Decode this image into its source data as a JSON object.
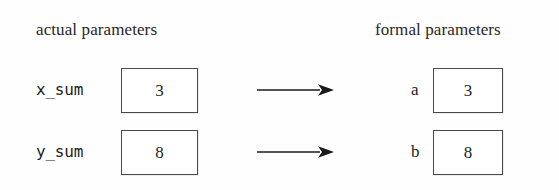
{
  "diagram": {
    "headers": {
      "actual": "actual parameters",
      "formal": "formal parameters"
    },
    "colors": {
      "background": "#fefefe",
      "text": "#231f20",
      "box_border": "#4a4a4a",
      "arrow": "#1a1a1a"
    },
    "rows": [
      {
        "actual_label": "x_sum",
        "actual_value": "3",
        "arrow": "right-arrow-icon",
        "formal_label": "a",
        "formal_value": "3"
      },
      {
        "actual_label": "y_sum",
        "actual_value": "8",
        "arrow": "right-arrow-icon",
        "formal_label": "b",
        "formal_value": "8"
      }
    ]
  }
}
